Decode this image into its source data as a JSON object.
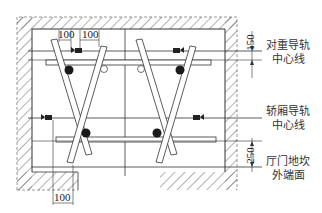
{
  "diagram": {
    "type": "elevator shaft plan - guide rail layout",
    "labels": {
      "counterweight_rail_center": [
        "对重导轨",
        "中心线"
      ],
      "car_rail_center": [
        "轿厢导轨",
        "中心线"
      ],
      "landing_door_sill": [
        "厅门地坎",
        "外端面"
      ]
    },
    "dimensions": {
      "top_left_1": "100",
      "top_left_2": "100",
      "right_upper": "150",
      "right_lower": "250",
      "bottom_left": "100"
    },
    "colors": {
      "line": "#333333",
      "hatch": "#555555",
      "background": "#ffffff",
      "dot": "#1a1a1a"
    }
  }
}
